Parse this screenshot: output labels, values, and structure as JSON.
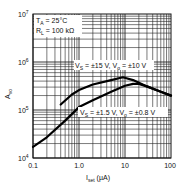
{
  "chart_data": {
    "type": "line",
    "title": "",
    "xlabel": "I_set (µA)",
    "ylabel": "A_vo",
    "x_scale": "log",
    "y_scale": "log",
    "xlim": [
      0.1,
      100
    ],
    "ylim": [
      10000,
      10000000
    ],
    "x_ticks": [
      "0.1",
      "1.0",
      "10",
      "100"
    ],
    "y_ticks": [
      "10^4",
      "10^5",
      "10^6",
      "10^7"
    ],
    "grid": true,
    "annotations": [
      "T_A = 25°C",
      "R_L = 100 kΩ"
    ],
    "series": [
      {
        "name": "V_S = ±15 V, V_o = ±10 V",
        "x": [
          0.4,
          0.7,
          1.0,
          2.0,
          5.0,
          9.0,
          15.0,
          30.0,
          60.0,
          100.0
        ],
        "y": [
          130000,
          210000,
          260000,
          340000,
          420000,
          480000,
          420000,
          310000,
          240000,
          200000
        ]
      },
      {
        "name": "V_S = ±1.5 V, V_o = ±0.8 V",
        "x": [
          0.1,
          0.2,
          0.5,
          1.0,
          2.0,
          5.0,
          10.0,
          15.0,
          20.0,
          30.0,
          60.0,
          100.0
        ],
        "y": [
          17000,
          27000,
          60000,
          115000,
          160000,
          240000,
          320000,
          350000,
          350000,
          310000,
          240000,
          200000
        ]
      }
    ]
  },
  "labels": {
    "y7": "10",
    "y7e": "7",
    "y6": "10",
    "y6e": "6",
    "y5": "10",
    "y5e": "5",
    "y4": "10",
    "y4e": "4",
    "x0": "0.1",
    "x1": "1.0",
    "x2": "10",
    "x3": "100",
    "xlabel_main": "I",
    "xlabel_sub": "set",
    "xlabel_unit": " (µA)",
    "ylabel_main": "A",
    "ylabel_sub": "vo",
    "ta": "T",
    "ta_sub": "A",
    "ta_val": " = 25°C",
    "rl": "R",
    "rl_sub": "L",
    "rl_val": " = 100 kΩ",
    "s1_a": "V",
    "s1_as": "S",
    "s1_b": " = ±15 V, V",
    "s1_bs": "o",
    "s1_c": " = ±10 V",
    "s2_a": "V",
    "s2_as": "S",
    "s2_b": " = ±1.5 V, V",
    "s2_bs": "o",
    "s2_c": " = ±0.8 V"
  }
}
